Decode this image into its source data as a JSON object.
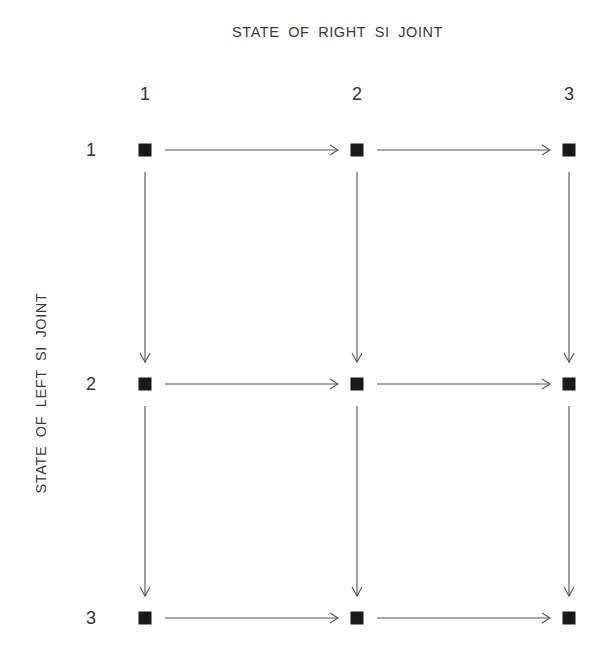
{
  "title_top": "STATE OF RIGHT SI JOINT",
  "title_left": "STATE OF LEFT SI JOINT",
  "columns": [
    {
      "label": "1",
      "x": 145
    },
    {
      "label": "2",
      "x": 357
    },
    {
      "label": "3",
      "x": 569
    }
  ],
  "rows": [
    {
      "label": "1",
      "y": 150
    },
    {
      "label": "2",
      "y": 384
    },
    {
      "label": "3",
      "y": 618
    }
  ],
  "colors": {
    "node": "#1a1a1a",
    "arrow": "#555555",
    "text": "#333333"
  },
  "edges": [
    {
      "from": "1,1",
      "to": "1,2"
    },
    {
      "from": "1,2",
      "to": "1,3"
    },
    {
      "from": "2,1",
      "to": "2,2"
    },
    {
      "from": "2,2",
      "to": "2,3"
    },
    {
      "from": "3,1",
      "to": "3,2"
    },
    {
      "from": "3,2",
      "to": "3,3"
    },
    {
      "from": "1,1",
      "to": "2,1"
    },
    {
      "from": "2,1",
      "to": "3,1"
    },
    {
      "from": "1,2",
      "to": "2,2"
    },
    {
      "from": "2,2",
      "to": "3,2"
    },
    {
      "from": "1,3",
      "to": "2,3"
    },
    {
      "from": "2,3",
      "to": "3,3"
    }
  ]
}
